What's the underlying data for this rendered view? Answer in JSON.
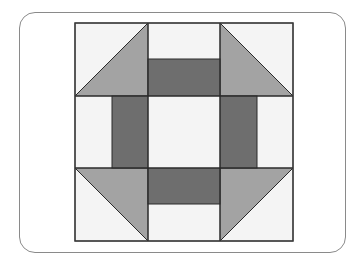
{
  "diagram": {
    "type": "quilt-block",
    "name": "Churn Dash",
    "grid": "3x3",
    "colors": {
      "background": "#f4f4f4",
      "light_triangle": "#a3a3a3",
      "dark_rect": "#6e6e6e",
      "outline": "#2a2a2a",
      "frame": "#8a8a8a"
    },
    "geometry": {
      "x0": 75,
      "y0": 23,
      "size": 218
    }
  }
}
